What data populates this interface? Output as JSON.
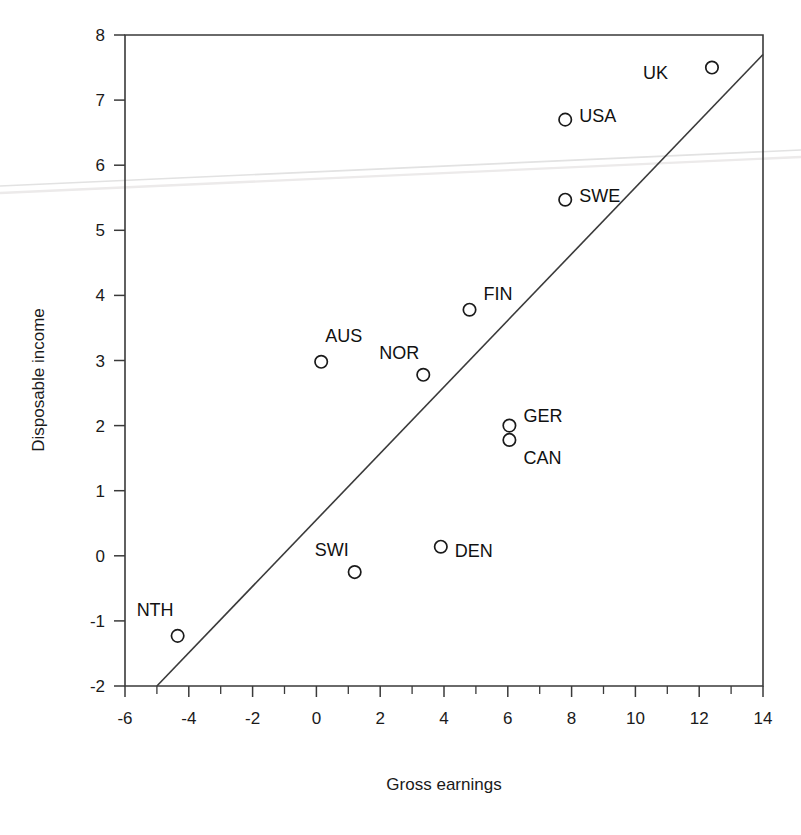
{
  "chart_data": {
    "type": "scatter",
    "title": "",
    "xlabel": "Gross earnings",
    "ylabel": "Disposable income",
    "xlim": [
      -6,
      14
    ],
    "ylim": [
      -2,
      8
    ],
    "grid": false,
    "legend_position": "none",
    "xticks": [
      -6,
      -4,
      -2,
      0,
      2,
      4,
      6,
      8,
      10,
      12,
      14
    ],
    "xtick_labels": [
      "-6",
      "-4",
      "-2",
      "0",
      "2",
      "4",
      "6",
      "8",
      "10",
      "12",
      "14"
    ],
    "xminor_step": 1,
    "yticks": [
      -2,
      -1,
      0,
      1,
      2,
      3,
      4,
      5,
      6,
      7,
      8
    ],
    "ytick_labels": [
      "-2",
      "-1",
      "0",
      "1",
      "2",
      "3",
      "4",
      "5",
      "6",
      "7",
      "8"
    ],
    "points": [
      {
        "label": "UK",
        "x": 12.4,
        "y": 7.5,
        "label_dx": -44,
        "label_dy": 5
      },
      {
        "label": "USA",
        "x": 7.8,
        "y": 6.7,
        "label_dx": 14,
        "label_dy": -4
      },
      {
        "label": "SWE",
        "x": 7.8,
        "y": 5.47,
        "label_dx": 14,
        "label_dy": -4
      },
      {
        "label": "FIN",
        "x": 4.8,
        "y": 3.78,
        "label_dx": 14,
        "label_dy": -16
      },
      {
        "label": "AUS",
        "x": 0.15,
        "y": 2.98,
        "label_dx": 4,
        "label_dy": -26
      },
      {
        "label": "NOR",
        "x": 3.35,
        "y": 2.78,
        "label_dx": -4,
        "label_dy": -22
      },
      {
        "label": "GER",
        "x": 6.05,
        "y": 2.0,
        "label_dx": 14,
        "label_dy": -10
      },
      {
        "label": "CAN",
        "x": 6.05,
        "y": 1.78,
        "label_dx": 14,
        "label_dy": 18
      },
      {
        "label": "DEN",
        "x": 3.9,
        "y": 0.14,
        "label_dx": 14,
        "label_dy": 4
      },
      {
        "label": "SWI",
        "x": 1.2,
        "y": -0.25,
        "label_dx": -6,
        "label_dy": -22
      },
      {
        "label": "NTH",
        "x": -4.35,
        "y": -1.23,
        "label_dx": -4,
        "label_dy": -26
      }
    ],
    "trend_line": {
      "x_start": -5.0,
      "y_start": -2.0,
      "x_end": 14.0,
      "y_end": 7.7
    }
  }
}
